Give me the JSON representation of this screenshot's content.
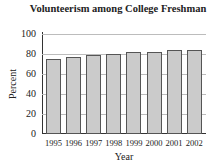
{
  "chart_data": {
    "type": "bar",
    "title": "Volunteerism among College Freshman",
    "xlabel": "Year",
    "ylabel": "Percent",
    "categories": [
      "1995",
      "1996",
      "1997",
      "1998",
      "1999",
      "2000",
      "2001",
      "2002"
    ],
    "values": [
      75,
      77,
      79,
      80,
      82,
      82,
      84,
      84
    ],
    "ylim": [
      0,
      100
    ],
    "yticks": [
      "0",
      "20",
      "40",
      "60",
      "80",
      "100"
    ],
    "grid": true,
    "legend": null,
    "colors": {
      "bar_fill": "#cbcbcb",
      "bar_edge": "#555555",
      "grid": "#bcbcbc"
    }
  }
}
